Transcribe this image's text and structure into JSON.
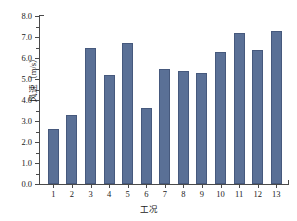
{
  "chart_data": {
    "type": "bar",
    "title": "",
    "xlabel": "工况",
    "ylabel": "风速（m/s）",
    "categories": [
      "1",
      "2",
      "3",
      "4",
      "5",
      "6",
      "7",
      "8",
      "9",
      "10",
      "11",
      "12",
      "13"
    ],
    "values": [
      2.6,
      3.3,
      6.5,
      5.2,
      6.7,
      3.6,
      5.5,
      5.4,
      5.3,
      6.3,
      7.2,
      6.4,
      7.3
    ],
    "series": [
      {
        "name": "风速",
        "values": [
          2.6,
          3.3,
          6.5,
          5.2,
          6.7,
          3.6,
          5.5,
          5.4,
          5.3,
          6.3,
          7.2,
          6.4,
          7.3
        ]
      }
    ],
    "ylim": [
      0.0,
      8.0
    ],
    "ytick_labels": [
      "0.0",
      "1.0",
      "2.0",
      "3.0",
      "4.0",
      "5.0",
      "6.0",
      "7.0",
      "8.0"
    ],
    "ytick_values": [
      0.0,
      1.0,
      2.0,
      3.0,
      4.0,
      5.0,
      6.0,
      7.0,
      8.0
    ],
    "xtick_labels": [
      "1",
      "2",
      "3",
      "4",
      "5",
      "6",
      "7",
      "8",
      "9",
      "10",
      "11",
      "12",
      "13"
    ],
    "grid": false,
    "legend": false,
    "bar_color": "#5a7096",
    "bar_edge_color": "#46597d",
    "axis_color": "#4a4a4a",
    "background_color": "#ffffff"
  }
}
